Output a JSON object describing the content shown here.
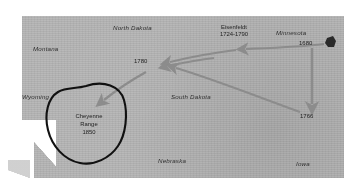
{
  "figure": {
    "kind": "historical-migration-map",
    "background_color": "#b9b9b9",
    "arrow_color": "#8c8c8c",
    "annotation_color": "#111111"
  },
  "state_labels": [
    {
      "name": "montana",
      "text": "Montana"
    },
    {
      "name": "north-dakota",
      "text": "North Dakota"
    },
    {
      "name": "minnesota",
      "text": "Minnesota"
    },
    {
      "name": "wyoming",
      "text": "Wyoming"
    },
    {
      "name": "south-dakota",
      "text": "South Dakota"
    },
    {
      "name": "nebraska",
      "text": "Nebraska"
    },
    {
      "name": "iowa",
      "text": "Iowa"
    }
  ],
  "site_labels": [
    {
      "name": "eisenfeld",
      "title": "Eisenfeldt",
      "dates": "1724-1790"
    }
  ],
  "date_markers": [
    {
      "name": "marker-1680",
      "text": "1680"
    },
    {
      "name": "marker-1780",
      "text": "1780"
    },
    {
      "name": "marker-1766",
      "text": "1766"
    }
  ],
  "annotation": {
    "circled_region_line1": "Cheyenne",
    "circled_region_line2": "Range",
    "circled_region_line3": "1850"
  }
}
